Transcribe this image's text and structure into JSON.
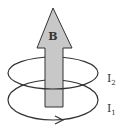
{
  "diagram": {
    "field_label": "B",
    "loops": [
      {
        "label": "I",
        "sub": "2"
      },
      {
        "label": "I",
        "sub": "1"
      }
    ],
    "colors": {
      "arrow_fill": "#c8c8c8",
      "stroke": "#333333",
      "background": "#ffffff"
    }
  }
}
